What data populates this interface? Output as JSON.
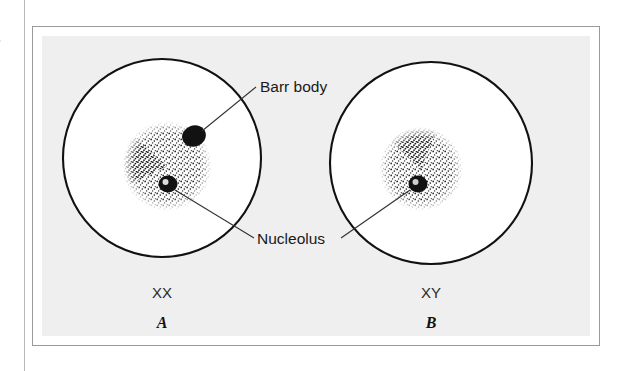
{
  "figure": {
    "background_color": "#efefef",
    "frame_color": "#9a9a9a",
    "margin_fragments": [
      "B",
      "e",
      "e",
      "0",
      "r",
      "i"
    ],
    "labels": {
      "barr_body": "Barr body",
      "nucleolus": "Nucleolus"
    },
    "panels": [
      {
        "id": "A",
        "letter": "A",
        "karyotype": "XX",
        "has_barr_body": true,
        "has_nucleolus": true,
        "cell": {
          "cx": 181,
          "cy": 167,
          "r": 99
        },
        "nucleus": {
          "cx": 186,
          "cy": 175,
          "r": 45
        },
        "barr_body": {
          "cx": 213,
          "cy": 145,
          "rx": 12,
          "ry": 10
        },
        "nucleolus": {
          "cx": 187,
          "cy": 193,
          "rx": 9,
          "ry": 8
        }
      },
      {
        "id": "B",
        "letter": "B",
        "karyotype": "XY",
        "has_barr_body": false,
        "has_nucleolus": true,
        "cell": {
          "cx": 450,
          "cy": 172,
          "r": 101
        },
        "nucleus": {
          "cx": 440,
          "cy": 178,
          "r": 42
        },
        "nucleolus": {
          "cx": 437,
          "cy": 193,
          "rx": 9,
          "ry": 8
        }
      }
    ],
    "leaders": {
      "barr_body": {
        "x1": 213,
        "y1": 145,
        "x2": 274,
        "y2": 96
      },
      "nucleolus_left": {
        "x1": 187,
        "y1": 193,
        "x2": 272,
        "y2": 246
      },
      "nucleolus_right": {
        "x1": 437,
        "y1": 193,
        "x2": 359,
        "y2": 246
      }
    },
    "colors": {
      "outline": "#111111",
      "stipple": "#1f1f1f",
      "blob": "#121212",
      "leader": "#333333"
    }
  }
}
